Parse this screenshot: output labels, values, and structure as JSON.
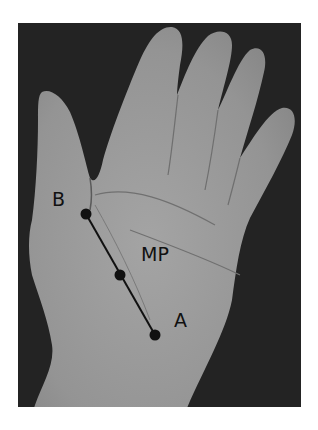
{
  "figure": {
    "background_color": "#232323",
    "skin_color": "#9a9a9a",
    "annotation_color": "#111111"
  },
  "labels": {
    "point_b": "B",
    "midpoint": "MP",
    "point_a": "A"
  },
  "points": [
    {
      "name": "B",
      "x": 86,
      "y": 214
    },
    {
      "name": "mid",
      "x": 120,
      "y": 275
    },
    {
      "name": "A",
      "x": 155,
      "y": 335
    }
  ]
}
